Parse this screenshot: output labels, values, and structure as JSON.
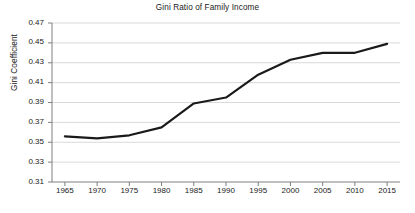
{
  "chart_data": {
    "type": "line",
    "title": "Gini Ratio of Family Income",
    "xlabel": "",
    "ylabel": "Gini Coefficient",
    "x": [
      1965,
      1970,
      1975,
      1980,
      1985,
      1990,
      1995,
      2000,
      2005,
      2010,
      2015
    ],
    "values": [
      0.356,
      0.354,
      0.357,
      0.365,
      0.389,
      0.395,
      0.418,
      0.433,
      0.44,
      0.44,
      0.449
    ],
    "series": [
      {
        "name": "Gini Coefficient",
        "values": [
          0.356,
          0.354,
          0.357,
          0.365,
          0.389,
          0.395,
          0.418,
          0.433,
          0.44,
          0.44,
          0.449
        ]
      }
    ],
    "xlim": [
      1963,
      2017
    ],
    "ylim": [
      0.31,
      0.47
    ],
    "xticks": [
      1965,
      1970,
      1975,
      1980,
      1985,
      1990,
      1995,
      2000,
      2005,
      2010,
      2015
    ],
    "xtick_labels": [
      "1965",
      "1970",
      "1975",
      "1980",
      "1985",
      "1990",
      "1995",
      "2000",
      "2005",
      "2010",
      "2015"
    ],
    "yticks": [
      0.31,
      0.33,
      0.35,
      0.37,
      0.39,
      0.41,
      0.43,
      0.45,
      0.47
    ],
    "ytick_labels": [
      "0.31",
      "0.33",
      "0.35",
      "0.37",
      "0.39",
      "0.41",
      "0.43",
      "0.45",
      "0.47"
    ],
    "grid": "horizontal",
    "legend": "none",
    "line_color": "#1a1a1a",
    "line_width": 2.2,
    "grid_color": "#d9d9d9",
    "axis_color": "#7f7f7f",
    "background": "#ffffff"
  }
}
